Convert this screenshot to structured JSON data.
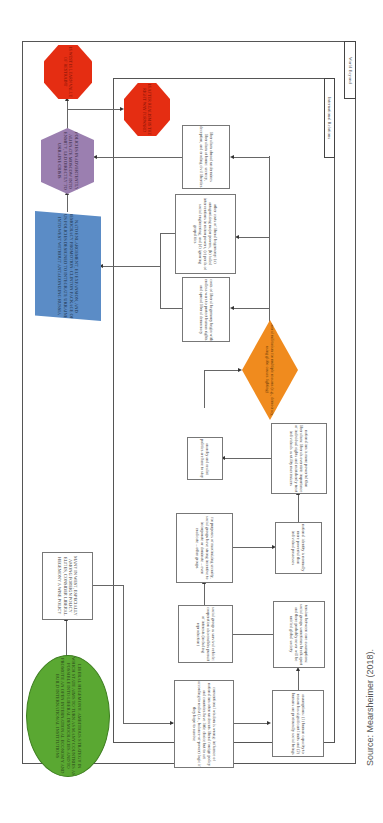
{
  "figure": {
    "orientation": "rotated 90 degrees clockwise",
    "source": "Source: Mearsheimer (2018).",
    "colors": {
      "ellipse_green": "#5aa832",
      "parallelogram_blue": "#5b8cc6",
      "hexagon_purple": "#9b7fb0",
      "octagon_red": "#e52d12",
      "diamond_orange": "#f08b1e"
    }
  },
  "frames": {
    "outer": {
      "label": "World Beyond"
    },
    "inner": {
      "label": "International Relations"
    }
  },
  "nodes": {
    "liberal_hegemony": "LIBERAL HEGEMONY: AMBITIOUS STRATEGY IN WHICH STATE AIMS TO TURN AS MANY COUNTRIES AS POSSIBLE INTO LIBERAL DEMOCRACIES AND TO PROMOTE AN OPEN INTERNATIONAL ECONOMY AND BUILD INTERNATIONAL INSTITUTIONS",
    "many_in_west": "MANY IN WEST, ESPECIALLY AMONG FOREIGN POLICY ELITES, CONSIDER LIBERAL HEGEMONY A WISE POLICY",
    "nato_enlargement": "NATO ENLARGEMENT, EU EXPANSION, AND DEMOCRACY PROMOTION: CLINTON PACKAGE OF US POLICIES DESIGNED TO INTEGRATE UKRAINE INTO WEST WITHOUT ANTAGONIZING RUSSIA",
    "policies_inadvertently": "POLICIES INADVERTENTLY ALIENATE MOSCOW INTO ENMITY, LED DIRECTLY TO UKRAINE CRISIS",
    "west_learn_realism": "IS WEST IS LEARN VALUE OF RESTRAINT",
    "realism_forward": "IS AFTER REALISM IS THE RIGHT WAY FORWARD",
    "conventional_wisdom": "conventional wisdom is wrong: influence of nationalism often undercuts liberal foreign policy and countries have little choice but to act according to realist (i.e., balance-of-power) logic if they hope to survive",
    "assumptions": "assumptions: (1) human capacity to reason has significant limits and (2) humans are profoundly social beings",
    "social_group": "social group as survival vehicle: cooperation also enables pursuit of interests (including reproduction)",
    "tension": "tension between core assumptions: social groups sometimes break apart and there probably never will be unified global society",
    "purposes_security": "for purposes of maximizing security, social groups have strong incentive to incorporate or dominate – even eradicate – other groups",
    "national_identity": "national identity is normally more powerful than individual possesses",
    "anarchy_realist": "anarchy and realist politics are here to stay",
    "nationalism_powerful": "nationalism is more powerful than liberalism: liberals overstate importance of individual rights and mistakenly treat individuals as utility maximizers",
    "liberal_militarism": "liberal militarism for multiple reasons (e.g., democracy, using globe causes fighting)",
    "costs_liberal": "costs of liberal hegemony begin with endless wars to protect human rights and spread liberal democracy",
    "other_costs": "other costs of liberal hegemony: (a) antagonizing major powers, (b) failed interventions in minor powers, (c) perils of social engineering, and (d) ignoring geopolitics",
    "liberalism_abroad": "liberalism abroad undermines liberalism at home: secrecy, deception, and eroding civil liberties"
  }
}
